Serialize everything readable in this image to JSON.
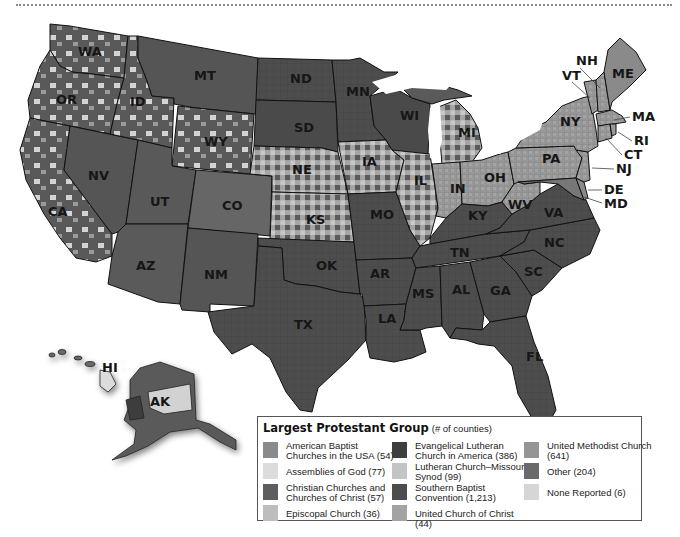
{
  "legend": {
    "title": "Largest Protestant Group",
    "subtitle": "(# of counties)",
    "columns": [
      [
        {
          "label": "American Baptist Churches in the USA (54)",
          "color": "#8a8a8a"
        },
        {
          "label": "Assemblies of God (77)",
          "color": "#dcdcdc"
        },
        {
          "label": "Christian Churches and Churches of Christ (57)",
          "color": "#5e5e5e"
        },
        {
          "label": "Episcopal Church (36)",
          "color": "#bdbdbd"
        }
      ],
      [
        {
          "label": "Evangelical Lutheran Church in America (386)",
          "color": "#3e3e3e"
        },
        {
          "label": "Lutheran Church–Missouri Synod (99)",
          "color": "#c4c4c4"
        },
        {
          "label": "Southern Baptist Convention (1,213)",
          "color": "#4d4d4d"
        },
        {
          "label": "United Church of Christ (44)",
          "color": "#a3a3a3"
        }
      ],
      [
        {
          "label": "United Methodist Church (641)",
          "color": "#959595"
        },
        {
          "label": "Other (204)",
          "color": "#6a6a6a"
        },
        {
          "label": "None Reported (6)",
          "color": "#d6d6d6"
        }
      ]
    ]
  },
  "states": {
    "WA": "WA",
    "OR": "OR",
    "CA": "CA",
    "NV": "NV",
    "ID": "ID",
    "MT": "MT",
    "WY": "WY",
    "UT": "UT",
    "AZ": "AZ",
    "CO": "CO",
    "NM": "NM",
    "ND": "ND",
    "SD": "SD",
    "NE": "NE",
    "KS": "KS",
    "OK": "OK",
    "TX": "TX",
    "MN": "MN",
    "IA": "IA",
    "MO": "MO",
    "AR": "AR",
    "LA": "LA",
    "WI": "WI",
    "IL": "IL",
    "MI": "MI",
    "IN": "IN",
    "OH": "OH",
    "KY": "KY",
    "TN": "TN",
    "MS": "MS",
    "AL": "AL",
    "GA": "GA",
    "FL": "FL",
    "SC": "SC",
    "NC": "NC",
    "VA": "VA",
    "WV": "WV",
    "PA": "PA",
    "NY": "NY",
    "VT": "VT",
    "NH": "NH",
    "ME": "ME",
    "MA": "MA",
    "RI": "RI",
    "CT": "CT",
    "NJ": "NJ",
    "DE": "DE",
    "MD": "MD",
    "HI": "HI",
    "AK": "AK"
  },
  "colors": {
    "southern_baptist": "#4d4d4d",
    "elca": "#3e3e3e",
    "methodist": "#959595",
    "assemblies": "#dcdcdc",
    "other": "#6a6a6a",
    "missouri_synod": "#c4c4c4",
    "water": "#ffffff",
    "border": "#111111"
  }
}
